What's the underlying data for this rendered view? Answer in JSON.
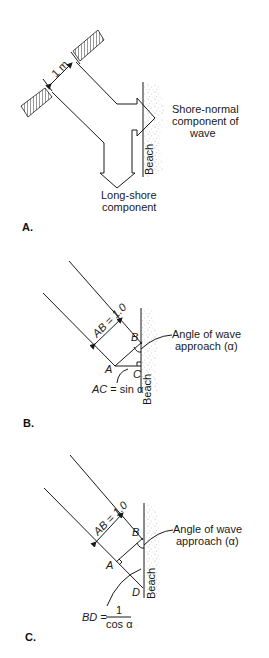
{
  "figure": {
    "panels": [
      {
        "id": "A",
        "panel_label": "A.",
        "width_label": "1 m",
        "shore_normal_label": [
          "Shore-normal",
          "component of",
          "wave"
        ],
        "long_shore_label": [
          "Long-shore",
          "component"
        ],
        "beach_label": "Beach"
      },
      {
        "id": "B",
        "panel_label": "B.",
        "ab_label": "AB = 1.0",
        "point_a": "A",
        "point_b": "B",
        "point_c": "C",
        "angle_label": [
          "Angle of wave",
          "approach (α)"
        ],
        "ac_label": "AC = sin α",
        "beach_label": "Beach"
      },
      {
        "id": "C",
        "panel_label": "C.",
        "ab_label": "AB = 1.0",
        "point_a": "A",
        "point_b": "B",
        "point_d": "D",
        "angle_label": [
          "Angle of wave",
          "approach (α)"
        ],
        "bd_label_lhs": "BD =",
        "bd_label_num": "1",
        "bd_label_den": "cos α",
        "beach_label": "Beach"
      }
    ],
    "colors": {
      "line": "#1a1a1a",
      "stipple": "#b0b0b0",
      "background": "#ffffff"
    }
  }
}
